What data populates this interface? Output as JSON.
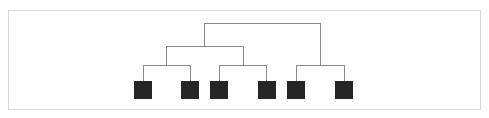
{
  "diagram": {
    "type": "tree",
    "colors": {
      "leaf": "#262626",
      "line": "#8a8a8a",
      "border": "#d6d6d6"
    },
    "leaves": [
      {
        "id": "leaf-1",
        "x": 134
      },
      {
        "id": "leaf-2",
        "x": 181
      },
      {
        "id": "leaf-3",
        "x": 210
      },
      {
        "id": "leaf-4",
        "x": 258
      },
      {
        "id": "leaf-5",
        "x": 287
      },
      {
        "id": "leaf-6",
        "x": 335
      }
    ],
    "structure": {
      "root": {
        "children": [
          "group-left",
          "group-right"
        ]
      },
      "group-left": {
        "children": [
          "pair-1",
          "pair-2"
        ]
      },
      "group-right": {
        "children": [
          "pair-3"
        ]
      },
      "pair-1": {
        "children": [
          "leaf-1",
          "leaf-2"
        ]
      },
      "pair-2": {
        "children": [
          "leaf-3",
          "leaf-4"
        ]
      },
      "pair-3": {
        "children": [
          "leaf-5",
          "leaf-6"
        ]
      }
    }
  }
}
